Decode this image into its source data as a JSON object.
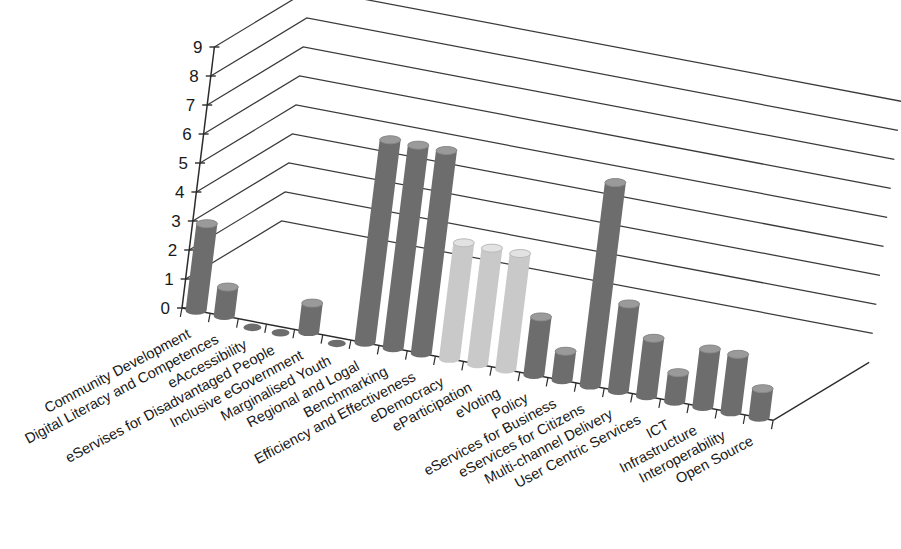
{
  "chart_data": {
    "type": "bar",
    "title": "",
    "subtitle": "",
    "xlabel": "",
    "ylabel": "",
    "ylim": [
      0,
      9
    ],
    "grid": true,
    "legend": false,
    "legend_position": "none",
    "projection": "3d",
    "ytick_labels": [
      "0",
      "1",
      "2",
      "3",
      "4",
      "5",
      "6",
      "7",
      "8",
      "9"
    ],
    "yticks": [
      0,
      1,
      2,
      3,
      4,
      5,
      6,
      7,
      8,
      9
    ],
    "categories": [
      "Community Development",
      "Digital Literacy and Competences",
      "eAccessibility",
      "eServises for Disadvantaged People",
      "Inclusive eGovernment",
      "Marginalised Youth",
      "Regional and Logal",
      "Benchmarking",
      "Efficiency and Effectiveness",
      "eDemocracy",
      "eParticipation",
      "eVoting",
      "Policy",
      "eServices for Business",
      "eServices for Citizens",
      "Multi-channel Delivery",
      "User Centric Services",
      "ICT",
      "Infrastructure",
      "Interoperability",
      "Open Source"
    ],
    "values": [
      3,
      1,
      0,
      0,
      1,
      0,
      7,
      7,
      7,
      4,
      4,
      4,
      2,
      1,
      7,
      3,
      2,
      1,
      2,
      2,
      1
    ],
    "bar_colors": [
      "#6d6d6d",
      "#6d6d6d",
      "#6d6d6d",
      "#6d6d6d",
      "#6d6d6d",
      "#6d6d6d",
      "#6d6d6d",
      "#6d6d6d",
      "#6d6d6d",
      "#c9c9c9",
      "#c9c9c9",
      "#c9c9c9",
      "#6d6d6d",
      "#6d6d6d",
      "#6d6d6d",
      "#6d6d6d",
      "#6d6d6d",
      "#6d6d6d",
      "#6d6d6d",
      "#6d6d6d",
      "#6d6d6d"
    ],
    "colors": {
      "bar_dark": "#6d6d6d",
      "bar_light": "#c9c9c9",
      "bar_cap_dark": "#9a9a9a",
      "bar_cap_light": "#e2e2e2",
      "axis": "#2b2b2b",
      "grid": "#3a3a3a",
      "background": "#ffffff",
      "text": "#171717"
    }
  }
}
